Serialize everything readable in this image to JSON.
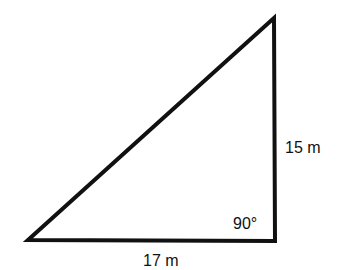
{
  "diagram": {
    "type": "right-triangle",
    "stroke_color": "#111111",
    "background_color": "#ffffff",
    "vertices": {
      "bottom_left": [
        28,
        240
      ],
      "top_right": [
        274,
        18
      ],
      "bottom_right": [
        275,
        241
      ]
    },
    "labels": {
      "vertical_side": "15 m",
      "horizontal_side": "17 m",
      "right_angle": "90°"
    }
  }
}
